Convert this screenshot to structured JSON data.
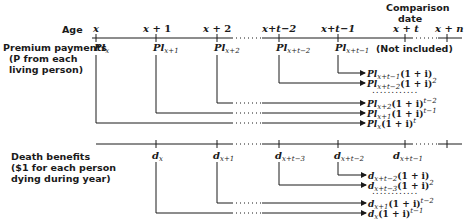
{
  "timeline": {
    "age_label": "Age",
    "comparison_date": {
      "line1": "Comparison",
      "line2": "date"
    },
    "ages": [
      {
        "base": "x",
        "op": "",
        "rest": ""
      },
      {
        "base": "x",
        "op": "+",
        "rest": "1"
      },
      {
        "base": "x",
        "op": "+",
        "rest": "2"
      },
      {
        "base": "x",
        "op": "+",
        "rest": "t−2"
      },
      {
        "base": "x",
        "op": "+",
        "rest": "t−1"
      },
      {
        "base": "x",
        "op": "+",
        "rest": "t"
      },
      {
        "base": "x",
        "op": "+",
        "rest": "n"
      }
    ]
  },
  "premiums": {
    "title": "Premium payments",
    "subtitle1": "(P from each",
    "subtitle2": "living person)",
    "symbol": "Pl",
    "labels": [
      "x",
      "x+1",
      "x+2",
      "x+t−2",
      "x+t−1"
    ],
    "not_included": "(Not included)",
    "accumulations": [
      {
        "sub": "x+t−1",
        "factor": "(1 + i)",
        "exp": ""
      },
      {
        "sub": "x+t−2",
        "factor": "(1 + i)",
        "exp": "2"
      },
      {
        "sub": "x+2",
        "factor": "(1 + i)",
        "exp": "t−2"
      },
      {
        "sub": "x+1",
        "factor": "(1 + i)",
        "exp": "t−1"
      },
      {
        "sub": "x",
        "factor": "(1 + i)",
        "exp": "t"
      }
    ],
    "ellipsis": "............"
  },
  "deaths": {
    "title": "Death benefits",
    "subtitle1": "($1 for each person",
    "subtitle2": "dying during year)",
    "symbol": "d",
    "labels": [
      "x",
      "x+1",
      "x+t−3",
      "x+t−2",
      "x+t−1"
    ],
    "accumulations": [
      {
        "sub": "x+t−2",
        "factor": "(1 + i)",
        "exp": ""
      },
      {
        "sub": "x+t−3",
        "factor": "(1 + i)",
        "exp": "2"
      },
      {
        "sub": "x+1",
        "factor": "(1 + i)",
        "exp": "t−2"
      },
      {
        "sub": "x",
        "factor": "(1 + i)",
        "exp": "t−1"
      }
    ],
    "ellipsis": "............"
  },
  "colors": {
    "ink": "#1a1a1a",
    "background": "#ffffff"
  }
}
